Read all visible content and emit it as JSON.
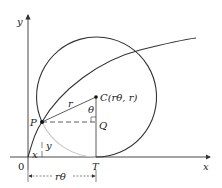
{
  "diagram": {
    "type": "cycloid-construction",
    "axes": {
      "x_label": "x",
      "y_label": "y",
      "origin_label": "0"
    },
    "points": {
      "P": {
        "label": "P"
      },
      "C": {
        "label": "C(rθ, r)"
      },
      "Q": {
        "label": "Q"
      },
      "T": {
        "label": "T"
      }
    },
    "segment_labels": {
      "radius": "r",
      "angle": "θ",
      "x_offset": "x",
      "y_offset": "y",
      "arc_length": "rθ"
    },
    "colors": {
      "stroke": "#333333",
      "arc_faded": "#c8c8c8",
      "background": "#ffffff"
    }
  }
}
